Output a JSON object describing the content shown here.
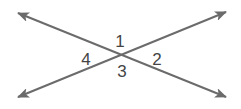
{
  "diagram": {
    "line_color": "#6b6b6b",
    "label_color": "#444444",
    "intersection": [
      122,
      55
    ],
    "lines": [
      {
        "id": "line-a",
        "from": [
          18,
          13
        ],
        "to": [
          226,
          97
        ]
      },
      {
        "id": "line-b",
        "from": [
          18,
          97
        ],
        "to": [
          226,
          12
        ]
      }
    ],
    "angles": [
      {
        "label": "1",
        "x": 120,
        "y": 41
      },
      {
        "label": "2",
        "x": 157,
        "y": 59
      },
      {
        "label": "3",
        "x": 122,
        "y": 71
      },
      {
        "label": "4",
        "x": 86,
        "y": 59
      }
    ]
  }
}
